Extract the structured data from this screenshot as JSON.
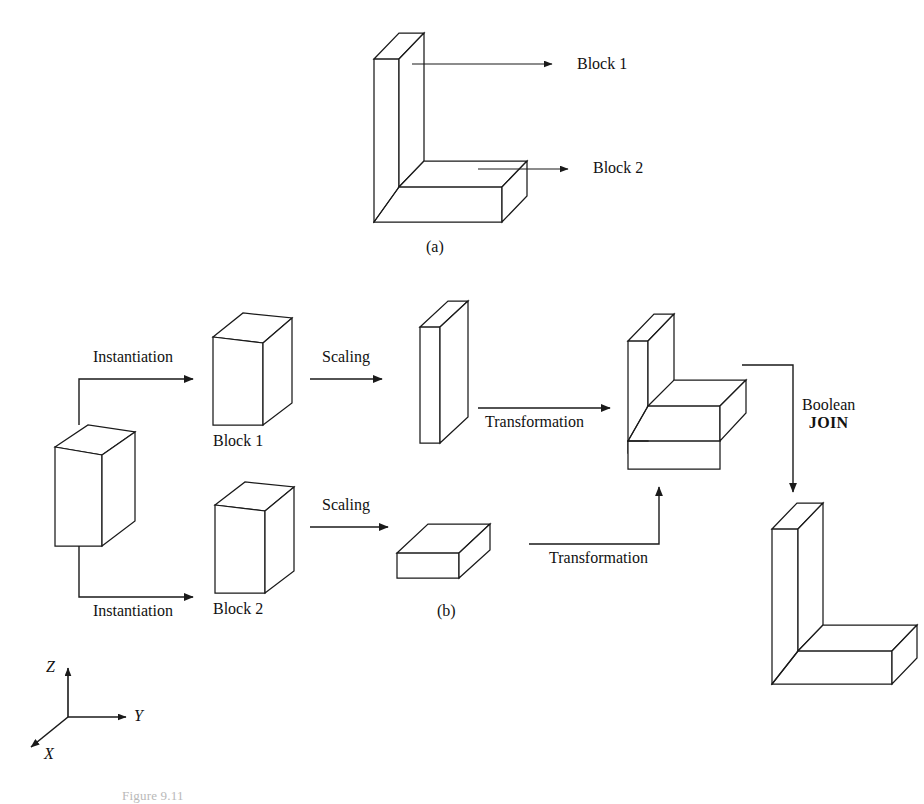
{
  "figure": {
    "subfigure_a_label": "(a)",
    "subfigure_b_label": "(b)",
    "caption": "Figure 9.11"
  },
  "part_a": {
    "callouts": [
      {
        "label": "Block 1"
      },
      {
        "label": "Block  2"
      }
    ]
  },
  "part_b": {
    "operations": {
      "instantiation_top": "Instantiation",
      "instantiation_bottom": "Instantiation",
      "scaling_top": "Scaling",
      "scaling_bottom": "Scaling",
      "transformation_top": "Transformation",
      "transformation_bottom": "Transformation",
      "boolean_line1": "Boolean",
      "boolean_line2": "JOIN"
    },
    "block_names": {
      "block1": "Block 1",
      "block2": "Block 2"
    }
  },
  "axes": {
    "z": "Z",
    "y": "Y",
    "x": "X"
  },
  "colors": {
    "stroke": "#1a1a1a",
    "face": "#ffffff",
    "background": "#ffffff"
  }
}
